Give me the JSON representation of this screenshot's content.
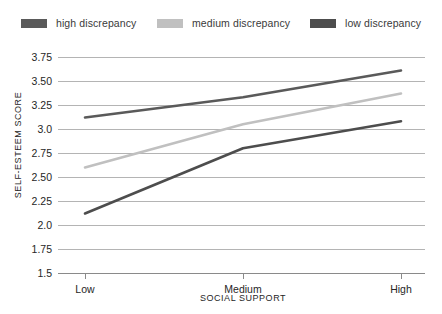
{
  "chart_data": {
    "type": "line",
    "title": "",
    "xlabel": "SOCIAL SUPPORT",
    "ylabel": "SELF-ESTEEM SCORE",
    "categories": [
      "Low",
      "Medium",
      "High"
    ],
    "ylim": [
      1.5,
      3.75
    ],
    "ytick_values": [
      3.75,
      3.5,
      3.25,
      3.0,
      2.75,
      2.5,
      2.25,
      2.0,
      1.75,
      1.5
    ],
    "ytick_labels": [
      "3.75",
      "3.50",
      "3.25",
      "3.0",
      "2.75",
      "2.50",
      "2.25",
      "2.0",
      "1.75",
      "1.5"
    ],
    "grid": true,
    "legend_position": "top",
    "series": [
      {
        "name": "high discrepancy",
        "color": "#5a5a5a",
        "values": [
          3.12,
          3.33,
          3.61
        ]
      },
      {
        "name": "medium discrepancy",
        "color": "#c0c0c0",
        "values": [
          2.6,
          3.05,
          3.37
        ]
      },
      {
        "name": "low discrepancy",
        "color": "#4d4d4d",
        "values": [
          2.12,
          2.8,
          3.08
        ]
      }
    ]
  },
  "legend": {
    "entries": [
      {
        "label": "high discrepancy",
        "color": "#5a5a5a"
      },
      {
        "label": "medium discrepancy",
        "color": "#c0c0c0"
      },
      {
        "label": "low discrepancy",
        "color": "#4d4d4d"
      }
    ]
  },
  "axes": {
    "y_title": "SELF-ESTEEM SCORE",
    "x_title": "SOCIAL SUPPORT",
    "y_ticks": [
      "3.75",
      "3.50",
      "3.25",
      "3.0",
      "2.75",
      "2.50",
      "2.25",
      "2.0",
      "1.75",
      "1.5"
    ],
    "x_ticks": [
      "Low",
      "Medium",
      "High"
    ]
  },
  "colors": {
    "grid": "#b4b4b4",
    "axis": "#8a8a8a",
    "text": "#262626",
    "background": "#ffffff"
  }
}
